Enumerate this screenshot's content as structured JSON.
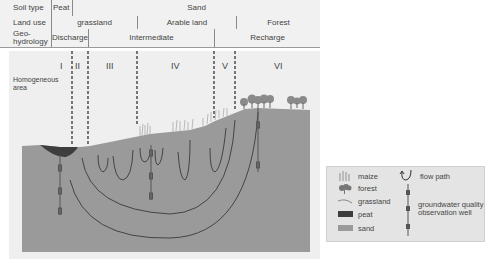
{
  "table": {
    "rows": [
      {
        "header": "Soil type",
        "cells": [
          {
            "label": "Peat"
          },
          {
            "label": "Sand"
          }
        ]
      },
      {
        "header": "Land use",
        "cells": [
          {
            "label": "grassland"
          },
          {
            "label": "Arable land"
          },
          {
            "label": "Forest"
          }
        ]
      },
      {
        "header": "Geo-\nhydrology",
        "header_line1": "Geo-",
        "header_line2": "hydrology",
        "cells": [
          {
            "label": "Discharge"
          },
          {
            "label": "Intermediate"
          },
          {
            "label": "Recharge"
          }
        ]
      }
    ]
  },
  "diagram": {
    "zones": [
      "I",
      "II",
      "III",
      "IV",
      "V",
      "VI"
    ],
    "homogeneous_label_1": "Homogeneous",
    "homogeneous_label_2": "area"
  },
  "legend": {
    "items": [
      {
        "icon": "maize-icon",
        "label": "maize"
      },
      {
        "icon": "forest-icon",
        "label": "forest"
      },
      {
        "icon": "grassland-icon",
        "label": "grassland"
      },
      {
        "icon": "peat-swatch",
        "label": "peat"
      },
      {
        "icon": "sand-swatch",
        "label": "sand"
      },
      {
        "icon": "flow-path-icon",
        "label": "flow path"
      },
      {
        "icon": "observation-well-icon",
        "label": "groundwater quality observation well",
        "line1": "groundwater quality",
        "line2": "observation well"
      }
    ]
  },
  "colors": {
    "sand": "#9a9a9a",
    "peat": "#3e3e3e",
    "sky": "#efefef",
    "header_bg": "#f1f1f1",
    "flow_line": "#3a3a3a",
    "well": "#555555"
  }
}
